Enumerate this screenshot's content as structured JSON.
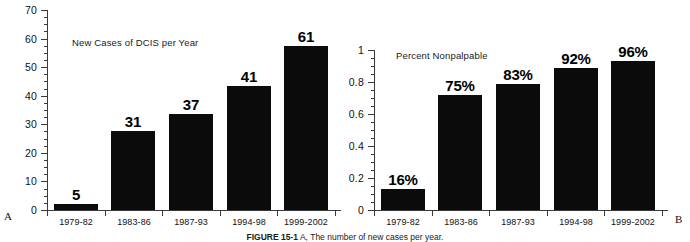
{
  "figure": {
    "caption_label": "FIGURE 15-1",
    "caption_text": "A, The number of new cases per year.",
    "background_color": "#ffffff",
    "bar_color": "#0b0b0b",
    "axis_color": "#3a3a3a"
  },
  "panel_a": {
    "letter": "A",
    "title": "New Cases of DCIS per Year"
  },
  "panel_b": {
    "letter": "B",
    "title": "Percent Nonpalpable"
  },
  "chart_data": [
    {
      "type": "bar",
      "panel": "A",
      "title": "New Cases of DCIS per Year",
      "xlabel": "",
      "ylabel": "",
      "ylim": [
        0,
        70
      ],
      "yticks": [
        0,
        10,
        20,
        30,
        40,
        50,
        60,
        70
      ],
      "ytick_labels": [
        "0",
        "10",
        "20",
        "30",
        "40",
        "50",
        "60",
        "70"
      ],
      "minor_tick_step": 2.5,
      "grid": false,
      "legend": false,
      "categories": [
        "1979-82",
        "1983-86",
        "1987-93",
        "1994-98",
        "1999-2002"
      ],
      "values": [
        5,
        31,
        37,
        41,
        61
      ],
      "bar_plot_values": [
        2.2,
        27.5,
        33.5,
        43.5,
        57.5
      ],
      "data_labels": [
        "5",
        "31",
        "37",
        "41",
        "61"
      ]
    },
    {
      "type": "bar",
      "panel": "B",
      "title": "Percent Nonpalpable",
      "xlabel": "",
      "ylabel": "",
      "ylim": [
        0,
        1
      ],
      "yticks": [
        0,
        0.2,
        0.4,
        0.6,
        0.8,
        1
      ],
      "ytick_labels": [
        "0",
        "0.2",
        "0.4",
        "0.6",
        "0.8",
        "1"
      ],
      "minor_tick_step": 0.05,
      "grid": false,
      "legend": false,
      "categories": [
        "1979-82",
        "1983-86",
        "1987-93",
        "1994-98",
        "1999-2002"
      ],
      "values": [
        0.16,
        0.75,
        0.83,
        0.92,
        0.96
      ],
      "bar_plot_values": [
        0.13,
        0.72,
        0.79,
        0.885,
        0.93
      ],
      "data_labels": [
        "16%",
        "75%",
        "83%",
        "92%",
        "96%"
      ]
    }
  ]
}
